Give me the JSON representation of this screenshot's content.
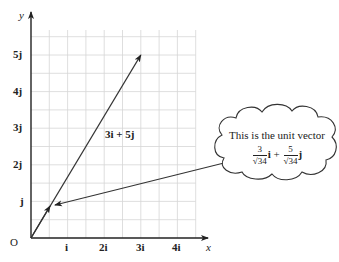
{
  "diagram": {
    "axes": {
      "x_name": "x",
      "y_name": "y",
      "origin_label": "O",
      "x_ticks": [
        "i",
        "2i",
        "3i",
        "4i"
      ],
      "y_ticks": [
        "j",
        "2j",
        "3j",
        "4j",
        "5j"
      ]
    },
    "vector": {
      "label": "3i + 5j",
      "components": {
        "x": 3,
        "y": 5
      }
    },
    "callout": {
      "text": "This is the unit vector",
      "term1": {
        "num": "3",
        "den": "√34",
        "unit": "i"
      },
      "operator": "+",
      "term2": {
        "num": "5",
        "den": "√34",
        "unit": "j"
      }
    },
    "colors": {
      "grid": "#d6d6d6",
      "axis": "#222222",
      "vector": "#333333"
    }
  }
}
